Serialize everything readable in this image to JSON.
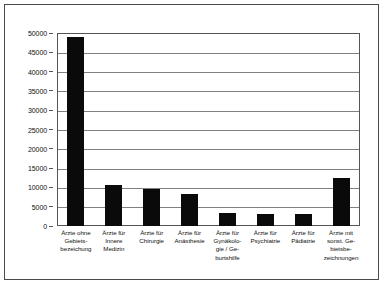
{
  "figure": {
    "background_color": "#ffffff",
    "frame_color": "#4a4a4a",
    "bar_color": "#0a0a0a",
    "grid_color": "#808080",
    "axis_color": "#555555"
  },
  "chart_data": {
    "type": "bar",
    "title": "",
    "subtitle": "",
    "xlabel": "",
    "ylabel": "",
    "ylim": [
      0,
      50000
    ],
    "ytick_step": 5000,
    "grid": true,
    "legend": false,
    "legend_position": "none",
    "orientation": "vertical",
    "categories": [
      "Ärzte ohne Gebiets-bezeichnung",
      "Ärzte für Innere Medizin",
      "Ärzte für Chirurgie",
      "Ärzte für Anästhesie",
      "Ärzte für Gynäkologie / Geburtshilfe",
      "Ärzte für Psychiatrie",
      "Ärzte für Pädiatrie",
      "Ärzte mit sonst. Gebietsbezeichnungen"
    ],
    "category_labels_wrapped": [
      "Ärzte ohne\nGebiets-\nbezeichung",
      "Ärzte für\nInnere\nMedizin",
      "Ärzte für\nChirurgie",
      "Ärzte für\nAnästhesie",
      "Ärzte für\nGynäkolo-\ngie / Ge-\nburtshilfe",
      "Ärzte für\nPsychiatrie",
      "Ärzte für\nPädiatrie",
      "Ärzte mit\nsonst. Ge-\nbietsbe-\nzeichnungen"
    ],
    "values": [
      49000,
      10500,
      9500,
      8300,
      3400,
      3200,
      3100,
      12500
    ],
    "ytick_labels": [
      "50000",
      "45000",
      "40000",
      "35000",
      "30000",
      "25000",
      "20000",
      "15000",
      "10000",
      "5000",
      "0"
    ],
    "ytick_values": [
      50000,
      45000,
      40000,
      35000,
      30000,
      25000,
      20000,
      15000,
      10000,
      5000,
      0
    ]
  }
}
